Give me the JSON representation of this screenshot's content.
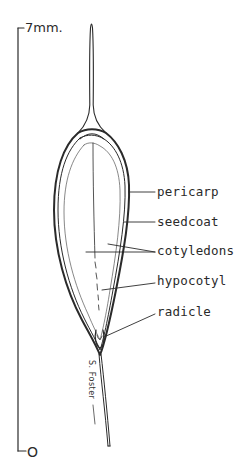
{
  "diagram": {
    "scale": {
      "top_label": "7mm.",
      "bottom_label": "O"
    },
    "labels": [
      {
        "id": "pericarp",
        "text": "pericarp"
      },
      {
        "id": "seedcoat",
        "text": "seedcoat"
      },
      {
        "id": "cotyledons",
        "text": "cotyledons"
      },
      {
        "id": "hypocotyl",
        "text": "hypocotyl"
      },
      {
        "id": "radicle",
        "text": "radicle"
      }
    ],
    "signature": "S. Foster",
    "colors": {
      "ink": "#2a2a2a",
      "background": "#ffffff"
    }
  }
}
